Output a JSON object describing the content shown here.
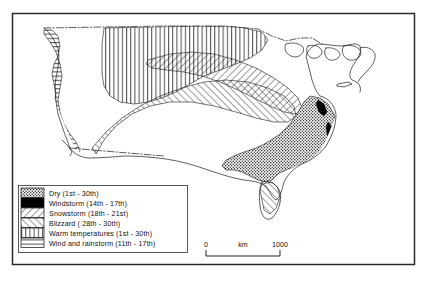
{
  "figure": {
    "domain": "map",
    "frame": {
      "x": 12,
      "y": 13,
      "width": 403,
      "height": 252
    }
  },
  "legend": {
    "name": "weather-event-legend",
    "box": {
      "x": 18,
      "y": 185,
      "width": 170,
      "height": 68
    },
    "items": [
      {
        "id": "dry",
        "pattern": "stipple",
        "label": "Dry  (1st - 30th)",
        "event": "Dry",
        "dates": "1st - 30th",
        "color": "#1a1a1a"
      },
      {
        "id": "windstorm",
        "pattern": "solid-black",
        "label": "Windstorm (14th - 17th)",
        "event": "Windstorm",
        "dates": "14th - 17th",
        "color": "#000000"
      },
      {
        "id": "snowstorm",
        "pattern": "diagonal-down",
        "label": "Snowstorm  (18th - 21st)",
        "event": "Snowstorm",
        "dates": "18th - 21st",
        "color": "#1a1a1a"
      },
      {
        "id": "blizzard",
        "pattern": "diagonal-up",
        "label": "Blizzard  ( 28th - 30th)",
        "event": "Blizzard",
        "dates": "28th - 30th",
        "color": "#1a1a1a"
      },
      {
        "id": "warm-temperatures",
        "pattern": "vertical-lines",
        "label": "Warm temperatures  (1st - 30th)",
        "event": "Warm temperatures",
        "dates": "1st - 30th",
        "color": "#1a1a1a"
      },
      {
        "id": "wind-and-rainstorm",
        "pattern": "horizontal-lines",
        "label": "Wind and rainstorm  (11th - 17th)",
        "event": "Wind and rainstorm",
        "dates": "11th - 17th",
        "color": "#1a1a1a"
      }
    ]
  },
  "scale_bar": {
    "name": "distance-scale-bar",
    "min_label": "0",
    "max_label": "1000",
    "unit_label": "km",
    "min_value": 0,
    "max_value": 1000,
    "units": "km"
  },
  "map_regions": [
    {
      "id": "wind-and-rainstorm",
      "area": "Pacific Northwest and California coast",
      "pattern": "horizontal-lines"
    },
    {
      "id": "warm-temperatures",
      "area": "Northern Plains and Great Lakes",
      "pattern": "vertical-lines"
    },
    {
      "id": "snowstorm",
      "area": "Upper Midwest into Northeast",
      "pattern": "diagonal-down"
    },
    {
      "id": "blizzard",
      "area": "Central Plains into Ohio Valley",
      "pattern": "diagonal-up"
    },
    {
      "id": "dry",
      "area": "Southeast and Gulf Coast",
      "pattern": "stipple"
    },
    {
      "id": "windstorm",
      "area": "Atlantic seaboard",
      "pattern": "solid-black"
    }
  ]
}
